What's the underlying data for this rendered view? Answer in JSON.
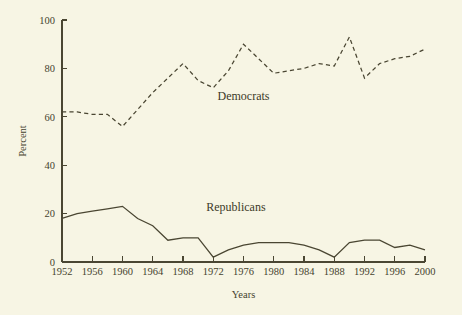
{
  "chart_data": {
    "type": "line",
    "title": "",
    "xlabel": "Years",
    "ylabel": "Percent",
    "xlim": [
      1952,
      2000
    ],
    "ylim": [
      0,
      100
    ],
    "grid": false,
    "legend_position": "inline-annotation",
    "x": [
      1952,
      1954,
      1956,
      1958,
      1960,
      1962,
      1964,
      1966,
      1968,
      1970,
      1972,
      1974,
      1976,
      1978,
      1980,
      1982,
      1984,
      1986,
      1988,
      1990,
      1992,
      1994,
      1996,
      1998,
      2000
    ],
    "x_tick_labels": [
      "1952",
      "1956",
      "1960",
      "1964",
      "1968",
      "1972",
      "1976",
      "1980",
      "1984",
      "1988",
      "1992",
      "1996",
      "2000"
    ],
    "x_tick_values": [
      1952,
      1956,
      1960,
      1964,
      1968,
      1972,
      1976,
      1980,
      1984,
      1988,
      1992,
      1996,
      2000
    ],
    "y_tick_labels": [
      "0",
      "20",
      "40",
      "60",
      "80",
      "100"
    ],
    "y_tick_values": [
      0,
      20,
      40,
      60,
      80,
      100
    ],
    "series": [
      {
        "name": "Democrats",
        "style": "dashed",
        "label_x": 1976,
        "label_y": 67,
        "values": [
          62,
          62,
          61,
          61,
          56,
          63,
          70,
          76,
          82,
          75,
          72,
          79,
          90,
          84,
          78,
          79,
          80,
          82,
          81,
          93,
          76,
          82,
          84,
          85,
          88
        ]
      },
      {
        "name": "Republicans",
        "style": "solid",
        "label_x": 1975,
        "label_y": 21,
        "values": [
          18,
          20,
          21,
          22,
          23,
          18,
          15,
          9,
          10,
          10,
          2,
          5,
          7,
          8,
          8,
          8,
          7,
          5,
          2,
          8,
          9,
          9,
          6,
          7,
          5
        ]
      }
    ]
  }
}
